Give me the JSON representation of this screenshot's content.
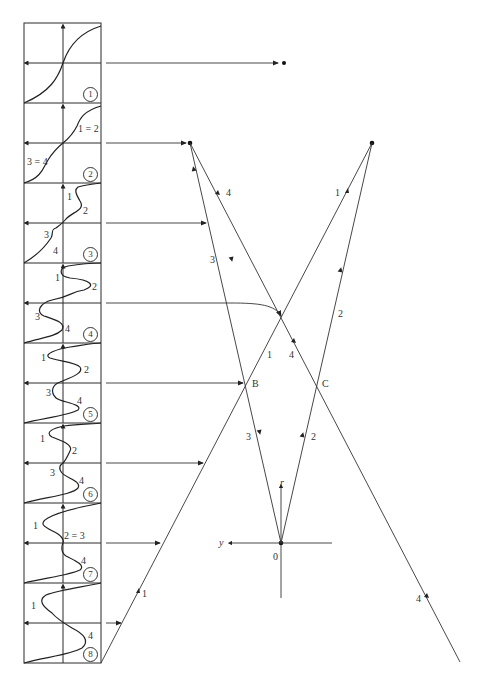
{
  "figure": {
    "panels": [
      {
        "number": "1",
        "labels": []
      },
      {
        "number": "2",
        "labels": [
          "1 = 2",
          "3 = 4"
        ]
      },
      {
        "number": "3",
        "labels": [
          "1",
          "2",
          "3",
          "4"
        ]
      },
      {
        "number": "4",
        "labels": [
          "1",
          "2",
          "3",
          "4"
        ]
      },
      {
        "number": "5",
        "labels": [
          "1",
          "2",
          "3",
          "4"
        ]
      },
      {
        "number": "6",
        "labels": [
          "1",
          "2",
          "3",
          "4"
        ]
      },
      {
        "number": "7",
        "labels": [
          "1",
          "2 = 3",
          "4"
        ]
      },
      {
        "number": "8",
        "labels": [
          "1",
          "4"
        ]
      }
    ],
    "ray_diagram": {
      "points": {
        "B": "B",
        "C": "C",
        "origin": "0"
      },
      "axes": {
        "vertical": "r",
        "horizontal": "y"
      },
      "ray_labels": {
        "left_ray4_upper": "4",
        "left_ray3": "3",
        "left_ray3_lower": "3",
        "right_ray1_upper": "1",
        "right_ray2": "2",
        "right_ray2_lower": "2",
        "ray1_mid": "1",
        "ray4_mid": "4",
        "ray1_bottom": "1",
        "ray4_bottom": "4"
      }
    }
  }
}
